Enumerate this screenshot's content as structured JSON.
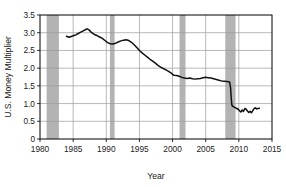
{
  "chart_data": {
    "type": "line",
    "title": "",
    "xlabel": "Year",
    "ylabel": "U.S. Money Multiplier",
    "xlim": [
      1980,
      2015
    ],
    "ylim": [
      0,
      3.5
    ],
    "xticks": [
      1980,
      1985,
      1990,
      1995,
      2000,
      2005,
      2010,
      2015
    ],
    "xtick_labels": [
      "1980",
      "1985",
      "1990",
      "1995",
      "2000",
      "2005",
      "2010",
      "2015"
    ],
    "yticks": [
      0,
      0.5,
      1.0,
      1.5,
      2.0,
      2.5,
      3.0,
      3.5
    ],
    "ytick_labels": [
      "0",
      "0.5",
      "1.0",
      "1.5",
      "2.0",
      "2.5",
      "3.0",
      "3.5"
    ],
    "grid": "horizontal-and-vertical",
    "legend": "none",
    "line_color": "#111111",
    "recession_band_color": "#b3b3b3",
    "recession_bands": [
      {
        "start": 1981.0,
        "end": 1982.85
      },
      {
        "start": 1990.55,
        "end": 1991.25
      },
      {
        "start": 2001.05,
        "end": 2001.95
      },
      {
        "start": 2007.95,
        "end": 2009.5
      }
    ],
    "series": [
      {
        "name": "U.S. Money Multiplier",
        "x": [
          1984.0,
          1984.4,
          1984.8,
          1985.1,
          1985.4,
          1985.7,
          1986.0,
          1986.3,
          1986.6,
          1986.9,
          1987.1,
          1987.4,
          1987.8,
          1988.2,
          1988.6,
          1989.0,
          1989.4,
          1989.8,
          1990.2,
          1990.6,
          1991.0,
          1991.4,
          1991.8,
          1992.2,
          1992.6,
          1993.0,
          1993.4,
          1993.8,
          1994.2,
          1994.6,
          1995.0,
          1995.4,
          1995.8,
          1996.2,
          1996.6,
          1997.0,
          1997.4,
          1997.8,
          1998.2,
          1998.6,
          1999.0,
          1999.4,
          1999.8,
          2000.0,
          2000.2,
          2000.6,
          2001.0,
          2001.4,
          2001.8,
          2002.2,
          2002.6,
          2003.0,
          2003.4,
          2003.8,
          2004.2,
          2004.6,
          2005.0,
          2005.4,
          2005.8,
          2006.2,
          2006.6,
          2007.0,
          2007.4,
          2007.8,
          2008.2,
          2008.6,
          2008.75,
          2008.85,
          2008.95,
          2009.1,
          2009.3,
          2009.5,
          2009.7,
          2009.9,
          2010.1,
          2010.3,
          2010.5,
          2010.7,
          2010.9,
          2011.1,
          2011.3,
          2011.5,
          2011.7,
          2011.9,
          2012.1,
          2012.3,
          2012.5,
          2012.7,
          2012.9,
          2013.1
        ],
        "y": [
          2.9,
          2.87,
          2.9,
          2.92,
          2.94,
          2.97,
          3.0,
          3.03,
          3.06,
          3.09,
          3.11,
          3.08,
          3.0,
          2.95,
          2.92,
          2.88,
          2.84,
          2.78,
          2.72,
          2.69,
          2.68,
          2.7,
          2.74,
          2.77,
          2.79,
          2.8,
          2.78,
          2.73,
          2.66,
          2.58,
          2.5,
          2.43,
          2.37,
          2.31,
          2.25,
          2.2,
          2.14,
          2.08,
          2.03,
          1.99,
          1.95,
          1.91,
          1.86,
          1.82,
          1.8,
          1.79,
          1.77,
          1.74,
          1.72,
          1.71,
          1.72,
          1.7,
          1.69,
          1.7,
          1.71,
          1.73,
          1.74,
          1.73,
          1.72,
          1.7,
          1.68,
          1.66,
          1.64,
          1.63,
          1.62,
          1.61,
          1.45,
          1.15,
          0.95,
          0.92,
          0.9,
          0.88,
          0.86,
          0.84,
          0.8,
          0.76,
          0.82,
          0.78,
          0.86,
          0.84,
          0.79,
          0.75,
          0.78,
          0.74,
          0.8,
          0.86,
          0.88,
          0.85,
          0.86,
          0.87
        ]
      }
    ]
  }
}
